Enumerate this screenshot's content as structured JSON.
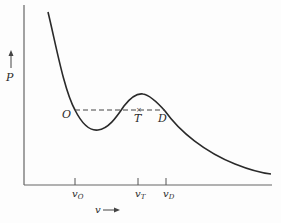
{
  "diagram": {
    "type": "pv-isotherm",
    "y_axis": {
      "label": "P",
      "arrow": "up-arrow"
    },
    "x_axis": {
      "label": "v",
      "arrow": "right-arrow"
    },
    "points": [
      {
        "id": "O",
        "label": "O"
      },
      {
        "id": "T",
        "label": "T"
      },
      {
        "id": "D",
        "label": "D"
      }
    ],
    "ticks": [
      {
        "id": "vO",
        "main": "v",
        "sub": "O"
      },
      {
        "id": "vT",
        "main": "v",
        "sub": "T"
      },
      {
        "id": "vD",
        "main": "v",
        "sub": "D"
      }
    ],
    "colors": {
      "line": "#2a2a2a",
      "axis": "#555555"
    }
  }
}
